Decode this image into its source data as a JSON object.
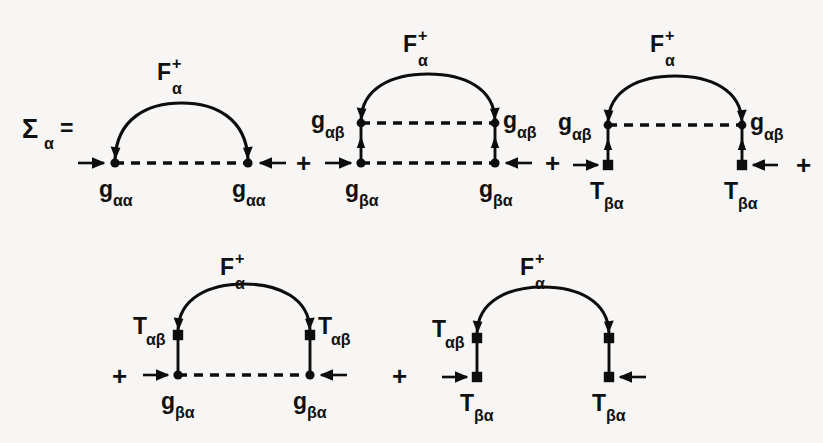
{
  "figure": {
    "type": "feynman-diagram-equation",
    "background_color": "#f7f6f4",
    "ink_color": "#0d0d0d",
    "lhs": {
      "symbol": "Σ",
      "subscript": "α",
      "equals": "="
    },
    "operator": "+",
    "propagator": {
      "symbol": "F",
      "superscript": "+",
      "subscript": "α"
    },
    "terms": [
      {
        "index": 1,
        "row": 1,
        "arc_label": {
          "symbol": "F",
          "superscript": "+",
          "subscript": "α"
        },
        "upper_vertices": null,
        "lower_vertices": {
          "left": "g",
          "left_sub": "αα",
          "right": "g",
          "right_sub": "αα",
          "shape": "dot"
        },
        "dashed_lines": [
          "bottom"
        ],
        "vertical_rungs": false
      },
      {
        "index": 2,
        "row": 1,
        "arc_label": {
          "symbol": "F",
          "superscript": "+",
          "subscript": "α"
        },
        "upper_vertices": {
          "left": "g",
          "left_sub": "αβ",
          "right": "g",
          "right_sub": "αβ",
          "shape": "dot"
        },
        "lower_vertices": {
          "left": "g",
          "left_sub": "βα",
          "right": "g",
          "right_sub": "βα",
          "shape": "dot"
        },
        "dashed_lines": [
          "top",
          "bottom"
        ],
        "vertical_rungs": true
      },
      {
        "index": 3,
        "row": 1,
        "arc_label": {
          "symbol": "F",
          "superscript": "+",
          "subscript": "α"
        },
        "upper_vertices": {
          "left": "g",
          "left_sub": "αβ",
          "right": "g",
          "right_sub": "αβ",
          "shape": "dot"
        },
        "lower_vertices": {
          "left": "T",
          "left_sub": "βα",
          "right": "T",
          "right_sub": "βα",
          "shape": "square"
        },
        "dashed_lines": [
          "top"
        ],
        "vertical_rungs": true
      },
      {
        "index": 4,
        "row": 2,
        "arc_label": {
          "symbol": "F",
          "superscript": "+",
          "subscript": "α"
        },
        "upper_vertices": {
          "left": "T",
          "left_sub": "αβ",
          "right": "T",
          "right_sub": "αβ",
          "shape": "square"
        },
        "lower_vertices": {
          "left": "g",
          "left_sub": "βα",
          "right": "g",
          "right_sub": "βα",
          "shape": "dot"
        },
        "dashed_lines": [
          "bottom"
        ],
        "vertical_rungs": true
      },
      {
        "index": 5,
        "row": 2,
        "arc_label": {
          "symbol": "F",
          "superscript": "+",
          "subscript": "α"
        },
        "upper_vertices": {
          "left": "T",
          "left_sub": "αβ",
          "right": "T",
          "right_sub": "αβ",
          "shape": "square"
        },
        "lower_vertices": {
          "left": "T",
          "left_sub": "βα",
          "right": "T",
          "right_sub": "βα",
          "shape": "square"
        },
        "dashed_lines": [],
        "vertical_rungs": true
      }
    ],
    "labels": {
      "sigma": "Σ",
      "sigma_sub": "α",
      "equals": "=",
      "plus1": "+",
      "plus2": "+",
      "plus3": "+",
      "plus4": "+",
      "plus5": "+",
      "F": "F",
      "F_sup": "+",
      "F_sub": "α",
      "g": "g",
      "T": "T",
      "aa": "αα",
      "ab": "αβ",
      "ba": "βα"
    }
  }
}
